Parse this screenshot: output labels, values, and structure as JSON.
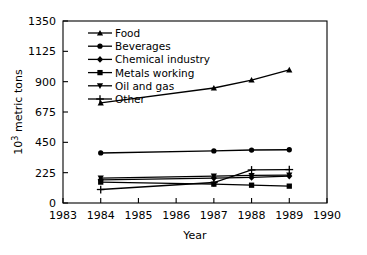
{
  "chart_data": {
    "type": "line",
    "title": "",
    "xlabel": "Year",
    "ylabel": "10³ metric tons",
    "ylabel_base": "10",
    "ylabel_exponent": "3",
    "ylabel_tail": " metric tons",
    "xlim": [
      1983,
      1990
    ],
    "ylim": [
      0,
      1350
    ],
    "xticks": [
      1983,
      1984,
      1985,
      1986,
      1987,
      1988,
      1989,
      1990
    ],
    "xtick_labels": [
      "1983",
      "1984",
      "1985",
      "1986",
      "1987",
      "1988",
      "1989",
      "1990"
    ],
    "yticks": [
      0,
      225,
      450,
      675,
      900,
      1125,
      1350
    ],
    "ytick_labels": [
      "0",
      "225",
      "450",
      "675",
      "900",
      "1125",
      "1350"
    ],
    "grid": false,
    "legend_position": "upper left",
    "x": [
      1984,
      1987,
      1988,
      1989
    ],
    "series": [
      {
        "name": "Food",
        "marker": "triangle-up",
        "color": "#000000",
        "values": [
          742,
          853,
          912,
          987
        ]
      },
      {
        "name": "Beverages",
        "marker": "circle",
        "color": "#000000",
        "values": [
          371,
          386,
          393,
          395
        ]
      },
      {
        "name": "Chemical industry",
        "marker": "diamond",
        "color": "#000000",
        "values": [
          172,
          185,
          190,
          200
        ]
      },
      {
        "name": "Metals working",
        "marker": "square",
        "color": "#000000",
        "values": [
          155,
          140,
          132,
          125
        ]
      },
      {
        "name": "Oil and gas",
        "marker": "triangle-down",
        "color": "#000000",
        "values": [
          185,
          200,
          205,
          207
        ]
      },
      {
        "name": "Other",
        "marker": "plus",
        "color": "#000000",
        "values": [
          100,
          152,
          245,
          248
        ]
      }
    ]
  },
  "axes": {
    "x_axis_label": "Year",
    "y_axis_label": "10³ metric tons"
  }
}
